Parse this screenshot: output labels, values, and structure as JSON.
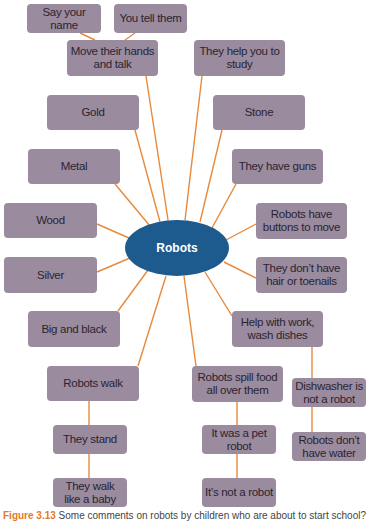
{
  "diagram": {
    "type": "mind-map",
    "center": {
      "label": "Robots",
      "color": "#1d5a8e"
    },
    "colors": {
      "node_fill": "#9a8b9f",
      "connector": "#e8893a",
      "node_text": "#2b2430"
    },
    "nodes": {
      "say_your_name": "Say your name",
      "you_tell_them": "You tell them",
      "move_hands_talk": "Move their hands and talk",
      "help_study": "They help you to study",
      "gold": "Gold",
      "stone": "Stone",
      "metal": "Metal",
      "have_guns": "They have guns",
      "wood": "Wood",
      "buttons_move": "Robots have buttons to move",
      "silver": "Silver",
      "no_hair": "They don’t have hair or toenails",
      "big_black": "Big and black",
      "help_work": "Help with work, wash dishes",
      "robots_walk": "Robots walk",
      "spill_food": "Robots spill food all over them",
      "dishwasher": "Dishwasher is not a robot",
      "they_stand": "They stand",
      "pet_robot": "It was a pet robot",
      "no_water": "Robots don’t have water",
      "walk_baby": "They walk like a baby",
      "not_robot": "It’s not a robot"
    }
  },
  "caption": {
    "label": "Figure 3.13",
    "text": "Some comments on robots by children who are about to start school?"
  }
}
